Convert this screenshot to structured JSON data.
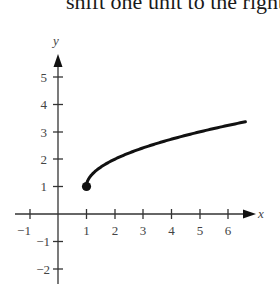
{
  "caption": "shift one unit to the right",
  "chart_data": {
    "type": "line",
    "title": "",
    "function": "y = sqrt(x - 1) + 1",
    "xlabel": "x",
    "ylabel": "y",
    "xlim": [
      -1.5,
      6.8
    ],
    "ylim": [
      -2.5,
      6
    ],
    "x_ticks": [
      -1,
      1,
      2,
      3,
      4,
      5,
      6
    ],
    "y_ticks": [
      -2,
      -1,
      1,
      2,
      3,
      4,
      5
    ],
    "grid": false,
    "series": [
      {
        "name": "y = √(x−1) + 1",
        "x": [
          1,
          1.1,
          1.25,
          1.5,
          2,
          2.5,
          3,
          3.5,
          4,
          4.5,
          5,
          5.5,
          6,
          6.6
        ],
        "y": [
          1,
          1.32,
          1.5,
          1.71,
          2,
          2.22,
          2.41,
          2.58,
          2.73,
          2.87,
          3,
          3.12,
          3.24,
          3.37
        ],
        "start_point": {
          "x": 1,
          "y": 1,
          "filled": true
        }
      }
    ]
  },
  "axes": {
    "x_label": "x",
    "y_label": "y",
    "x_tick_labels": [
      "−1",
      "1",
      "2",
      "3",
      "4",
      "5",
      "6"
    ],
    "y_tick_labels": [
      "5",
      "4",
      "3",
      "2",
      "1",
      "−1",
      "−2"
    ]
  }
}
